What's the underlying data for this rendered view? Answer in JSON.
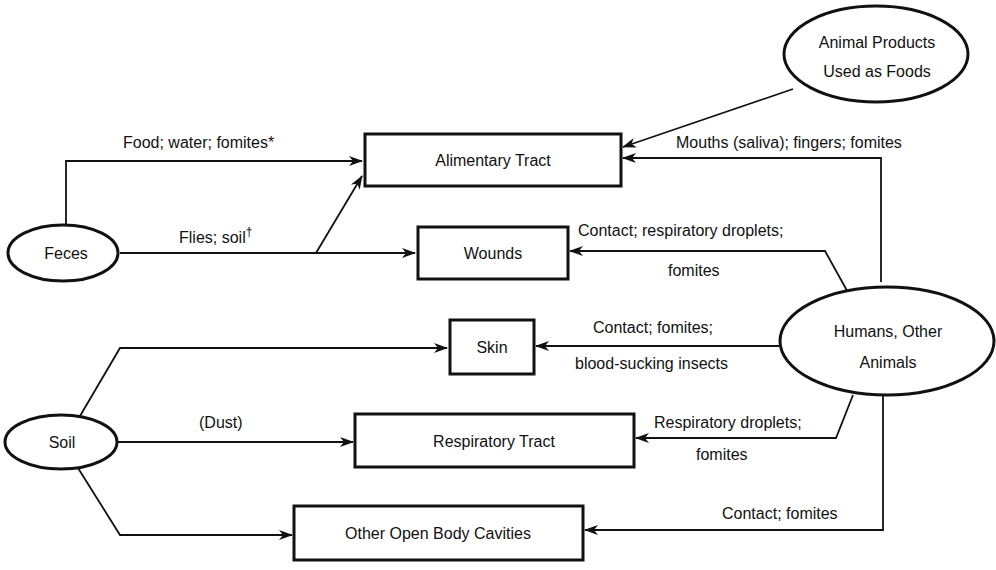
{
  "sources": {
    "feces": "Feces",
    "soil": "Soil",
    "animal_products": [
      "Animal Products",
      "Used as Foods"
    ],
    "humans_animals": [
      "Humans, Other",
      "Animals"
    ]
  },
  "targets": {
    "alimentary": "Alimentary Tract",
    "wounds": "Wounds",
    "skin": "Skin",
    "respiratory": "Respiratory Tract",
    "cavities": "Other Open Body Cavities"
  },
  "edges": {
    "feces_alimentary": "Food; water; fomites*",
    "feces_wounds": "Flies; soil",
    "feces_wounds_mark": "†",
    "humans_alimentary": "Mouths (saliva); fingers; fomites",
    "humans_wounds": [
      "Contact; respiratory droplets;",
      "fomites"
    ],
    "humans_skin": [
      "Contact; fomites;",
      "blood-sucking insects"
    ],
    "soil_respiratory": "(Dust)",
    "humans_respiratory": [
      "Respiratory droplets;",
      "fomites"
    ],
    "humans_cavities": "Contact; fomites"
  },
  "colors": {
    "ink": "#111111",
    "background": "#ffffff"
  }
}
